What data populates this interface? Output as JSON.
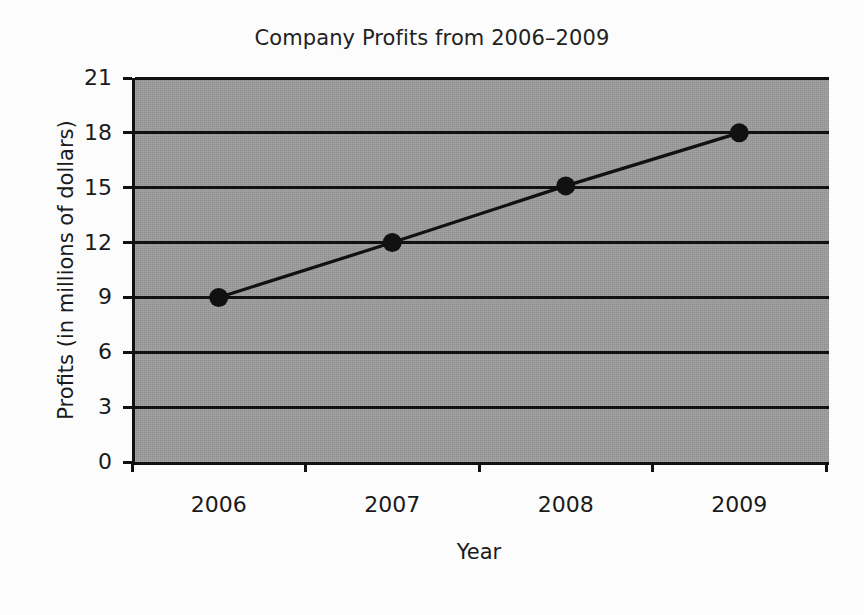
{
  "chart_data": {
    "type": "line",
    "title": "Company Profits from 2006–2009",
    "xlabel": "Year",
    "ylabel": "Profits (in millions of dollars)",
    "categories": [
      "2006",
      "2007",
      "2008",
      "2009"
    ],
    "values": [
      9,
      12,
      15.1,
      18
    ],
    "series": [
      {
        "name": "Profits",
        "values": [
          9,
          12,
          15.1,
          18
        ]
      }
    ],
    "x_tick_labels": [
      "2006",
      "2007",
      "2008",
      "2009"
    ],
    "y_tick_labels": [
      "0",
      "3",
      "6",
      "9",
      "12",
      "15",
      "18",
      "21"
    ],
    "y_ticks": [
      0,
      3,
      6,
      9,
      12,
      15,
      18,
      21
    ],
    "ylim": [
      0,
      21
    ],
    "grid": "horizontal",
    "legend": "none",
    "marker": "filled-circle",
    "colors": {
      "plot_background": "#9a9a9a",
      "page_background": "#fcfcfc",
      "line": "#111111",
      "marker": "#111111",
      "gridline": "#111111",
      "text": "#1a1a1a"
    }
  }
}
